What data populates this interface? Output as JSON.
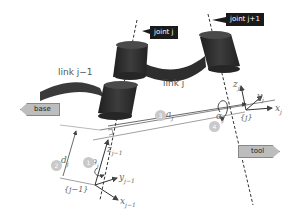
{
  "callouts": {
    "joint_j": "joint j",
    "joint_j1": "joint j+1"
  },
  "labels": {
    "link_j_minus_1": "link j−1",
    "link_j": "link j"
  },
  "tags": {
    "base": "base",
    "tool": "tool"
  },
  "math": {
    "z_j": "z",
    "z_j_sub": "j",
    "y_j": "y",
    "y_j_sub": "j",
    "x_j": "x",
    "x_j_sub": "j",
    "frame_j": "{j}",
    "a_j": "a",
    "a_j_sub": "j",
    "alpha_j": "α",
    "alpha_j_sub": "j",
    "z_jm1": "z",
    "z_jm1_sub": "j−1",
    "y_jm1": "y",
    "y_jm1_sub": "j−1",
    "x_jm1": "x",
    "x_jm1_sub": "j−1",
    "frame_jm1": "{j−1}",
    "d_j": "d",
    "d_j_sub": "j",
    "theta_j": "θ",
    "theta_j_sub": "j"
  },
  "badges": {
    "b1": "1",
    "b2": "2",
    "b3": "3",
    "b4": "4"
  },
  "colors": {
    "link": "#3a3a3a",
    "joint": "#2b2b2b",
    "callout": "#1a1a1a",
    "tag": "#bdbdbd",
    "badge": "#c9c9c9",
    "line": "#555555"
  }
}
